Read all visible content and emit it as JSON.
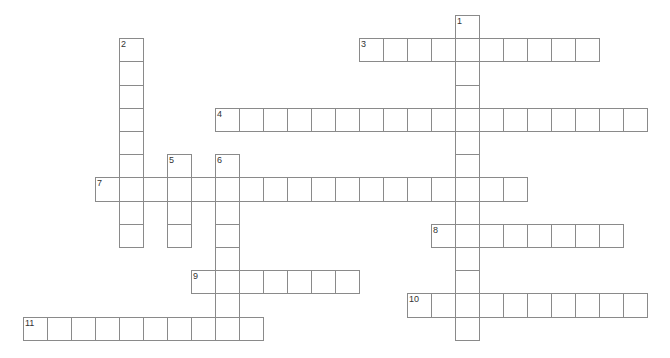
{
  "puzzle": {
    "type": "crossword",
    "grid": {
      "origin_x": 23,
      "origin_y": 15,
      "cell_w": 24,
      "cell_h": 23.2
    },
    "colors": {
      "border": "#8a8a8a",
      "number": "#333333",
      "background": "#ffffff"
    },
    "entries": [
      {
        "number": "1",
        "direction": "down",
        "row": 0,
        "col": 18,
        "length": 14
      },
      {
        "number": "2",
        "direction": "down",
        "row": 1,
        "col": 4,
        "length": 9
      },
      {
        "number": "3",
        "direction": "across",
        "row": 1,
        "col": 14,
        "length": 10
      },
      {
        "number": "4",
        "direction": "across",
        "row": 4,
        "col": 8,
        "length": 18
      },
      {
        "number": "5",
        "direction": "down",
        "row": 6,
        "col": 6,
        "length": 4
      },
      {
        "number": "6",
        "direction": "down",
        "row": 6,
        "col": 8,
        "length": 8
      },
      {
        "number": "7",
        "direction": "across",
        "row": 7,
        "col": 3,
        "length": 18
      },
      {
        "number": "8",
        "direction": "across",
        "row": 9,
        "col": 17,
        "length": 8
      },
      {
        "number": "9",
        "direction": "across",
        "row": 11,
        "col": 7,
        "length": 7
      },
      {
        "number": "10",
        "direction": "across",
        "row": 12,
        "col": 16,
        "length": 10
      },
      {
        "number": "11",
        "direction": "across",
        "row": 13,
        "col": 0,
        "length": 10
      }
    ]
  }
}
